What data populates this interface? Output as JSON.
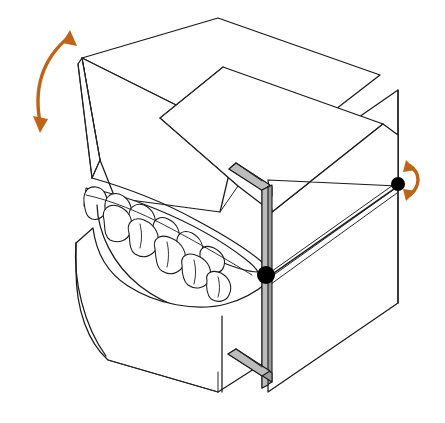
{
  "figure": {
    "background_color": "#ffffff",
    "line_color": "#1a1a1a",
    "accent_color": "#bf6316",
    "metal_color": "#9d9d9d",
    "pivot_color": "#000000",
    "canvas": {
      "width": 445,
      "height": 423
    }
  },
  "annotations": {
    "left_arrow": {
      "name": "opening-closing-motion-arrow",
      "style": "double-headed curved arrow",
      "color": "#bf6316",
      "meaning": "vertical opening and closing rotation of the upper member"
    },
    "right_arrow": {
      "name": "hinge-rotation-arrow",
      "style": "double-headed curved arrow",
      "color": "#bf6316",
      "meaning": "rotation about the condylar hinge axis"
    },
    "pivot_center": {
      "name": "condylar-hinge-pivot",
      "color": "#000000",
      "meaning": "hinge axis pivot point at the articulator joint"
    },
    "pivot_right": {
      "name": "condylar-hinge-pivot-right",
      "color": "#000000",
      "meaning": "hinge axis pivot point on the right side member"
    }
  },
  "parts": [
    {
      "name": "upper-member-plate",
      "label": "Upper member / maxillary mounting plate"
    },
    {
      "name": "upper-cast-block",
      "label": "Maxillary cast block"
    },
    {
      "name": "lower-cast-block",
      "label": "Mandibular cast block"
    },
    {
      "name": "right-side-panel",
      "label": "Right side frame panel"
    },
    {
      "name": "vertical-support-post",
      "label": "Vertical support post"
    },
    {
      "name": "upper-support-arm",
      "label": "Upper support arm"
    },
    {
      "name": "lower-support-arm",
      "label": "Lower support arm"
    },
    {
      "name": "guide-rail",
      "label": "Condylar guide rail / track"
    },
    {
      "name": "maxillary-dentition",
      "label": "Upper teeth (maxillary arch)"
    },
    {
      "name": "mandibular-dentition",
      "label": "Lower teeth (mandibular arch)"
    }
  ],
  "geometry": {
    "left_arrow_path": "M 41 127 C 34 96 38 62 70 36",
    "left_arrow_head_up": "70,30 77,46 62,43",
    "left_arrow_head_down": "40,133 33,116 48,119",
    "right_arrow_path": "M 409 165 C 421 173 421 186 409 196",
    "right_arrow_head_top": "406,160 416,170 403,172",
    "right_arrow_head_bottom": "406,201 403,189 416,191",
    "pivot_center": {
      "cx": 266,
      "cy": 275,
      "r": 9
    },
    "pivot_right": {
      "cx": 398,
      "cy": 184,
      "r": 7
    }
  }
}
